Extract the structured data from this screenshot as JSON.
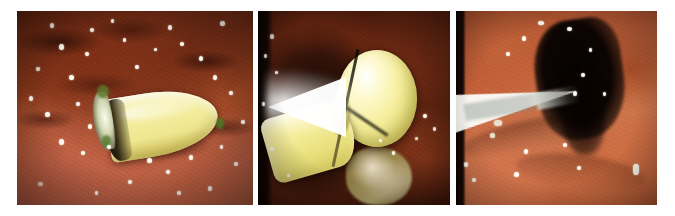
{
  "figure": {
    "caption": "",
    "background_color": "#ffffff",
    "panel_count": 3,
    "panels": [
      {
        "id": "panel-a",
        "label": "",
        "description": "Endoscopic view of small-bowel mucosa with a yellow capsule endoscope lying on the folds",
        "subject": "capsule-endoscope",
        "dominant_colors": [
          "#8a3a1c",
          "#c06a4e",
          "#f3ec9c",
          "#1d1308"
        ],
        "highlights": 34
      },
      {
        "id": "panel-b",
        "label": "",
        "description": "Close-up of the capsule endoscope illuminated by the endoscope light against a dark lumen with bile debris",
        "subject": "capsule-endoscope-close-up",
        "dominant_colors": [
          "#421608",
          "#f6ef9d",
          "#ffffff",
          "#c8b97e"
        ],
        "highlights": 11
      },
      {
        "id": "panel-c",
        "label": "",
        "description": "Endoscopic view of the lumen with a white instrument sheath entering a dark cavity",
        "subject": "instrument-in-lumen",
        "dominant_colors": [
          "#c2603a",
          "#d07a50",
          "#050201",
          "#fcfcf8"
        ],
        "highlights": 16
      }
    ]
  },
  "colors": {
    "page_background": "#ffffff",
    "mucosa_red": "#a24a27",
    "mucosa_pink": "#d07a50",
    "capsule_yellow": "#f3ec9c",
    "capsule_bright": "#fdf9cc",
    "lumen_dark": "#050201",
    "specular_white": "#fdfbf2"
  },
  "layout": {
    "image_width": 675,
    "image_height": 216,
    "strip_left": 17,
    "strip_top": 11,
    "strip_width": 640,
    "strip_height": 194,
    "panel_a_width": 236,
    "panel_b_width": 192,
    "panel_c_width": 201,
    "gap_width": 5
  }
}
